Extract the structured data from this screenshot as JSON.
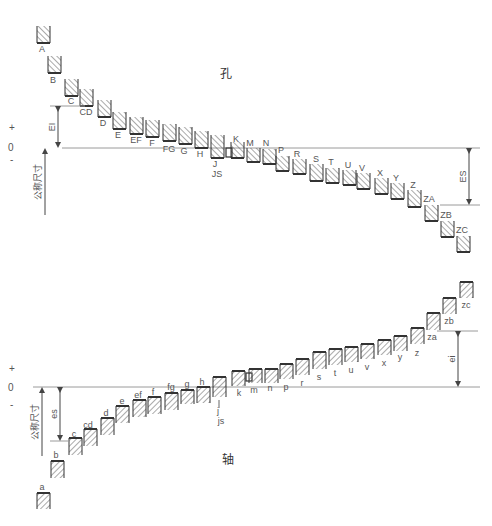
{
  "hole": {
    "title": "孔",
    "title_pos": [
      220,
      78
    ],
    "zero_y": 148,
    "zero_line": [
      62,
      480
    ],
    "signs": {
      "plus": "+",
      "zero": "0",
      "minus": "-",
      "plus_y": 131,
      "zero_y": 151,
      "minus_y": 163
    },
    "nominal_label": "公称尺寸",
    "nominal_arrow": {
      "x": 45,
      "y1": 148,
      "y2": 215
    },
    "EI": {
      "label": "EI",
      "x": 58,
      "y1": 106,
      "y2": 148,
      "ref_line": [
        50,
        85,
        106
      ]
    },
    "ES": {
      "label": "ES",
      "x": 469,
      "y1": 148,
      "y2": 205,
      "ref_line": [
        440,
        480,
        205
      ]
    },
    "boxes": [
      {
        "label": "A",
        "x": 37,
        "top": 26,
        "bottom": 43,
        "lx": 42,
        "ly": 52
      },
      {
        "label": "B",
        "x": 48,
        "top": 56,
        "bottom": 73,
        "lx": 53,
        "ly": 83
      },
      {
        "label": "C",
        "x": 65,
        "top": 79,
        "bottom": 96,
        "lx": 71,
        "ly": 104
      },
      {
        "label": "CD",
        "x": 80,
        "top": 89,
        "bottom": 106,
        "lx": 86,
        "ly": 115
      },
      {
        "label": "D",
        "x": 98,
        "top": 100,
        "bottom": 117,
        "lx": 103,
        "ly": 126
      },
      {
        "label": "E",
        "x": 113,
        "top": 112,
        "bottom": 129,
        "lx": 118,
        "ly": 138
      },
      {
        "label": "EF",
        "x": 130,
        "top": 117,
        "bottom": 134,
        "lx": 136,
        "ly": 143
      },
      {
        "label": "F",
        "x": 146,
        "top": 120,
        "bottom": 137,
        "lx": 152,
        "ly": 146
      },
      {
        "label": "FG",
        "x": 163,
        "top": 124,
        "bottom": 141,
        "lx": 169,
        "ly": 152
      },
      {
        "label": "G",
        "x": 179,
        "top": 127,
        "bottom": 144,
        "lx": 184,
        "ly": 154
      },
      {
        "label": "H",
        "x": 195,
        "top": 131,
        "bottom": 148,
        "lx": 200,
        "ly": 157
      },
      {
        "label": "J",
        "x": 211,
        "top": 135,
        "bottom": 158,
        "lx": 215,
        "ly": 167
      },
      {
        "label": "K",
        "x": 231,
        "top": 142,
        "bottom": 158,
        "lx": 236,
        "ly": 142
      },
      {
        "label": "M",
        "x": 247,
        "top": 148,
        "bottom": 162,
        "lx": 250,
        "ly": 146
      },
      {
        "label": "N",
        "x": 263,
        "top": 149,
        "bottom": 164,
        "lx": 266,
        "ly": 146
      },
      {
        "label": "P",
        "x": 276,
        "top": 156,
        "bottom": 171,
        "lx": 281,
        "ly": 153
      },
      {
        "label": "R",
        "x": 293,
        "top": 159,
        "bottom": 174,
        "lx": 297,
        "ly": 157
      },
      {
        "label": "S",
        "x": 310,
        "top": 164,
        "bottom": 181,
        "lx": 316,
        "ly": 162
      },
      {
        "label": "T",
        "x": 326,
        "top": 168,
        "bottom": 183,
        "lx": 331,
        "ly": 165
      },
      {
        "label": "U",
        "x": 343,
        "top": 170,
        "bottom": 185,
        "lx": 348,
        "ly": 168
      },
      {
        "label": "V",
        "x": 357,
        "top": 173,
        "bottom": 189,
        "lx": 362,
        "ly": 171
      },
      {
        "label": "X",
        "x": 375,
        "top": 178,
        "bottom": 194,
        "lx": 380,
        "ly": 176
      },
      {
        "label": "Y",
        "x": 391,
        "top": 183,
        "bottom": 199,
        "lx": 396,
        "ly": 181
      },
      {
        "label": "Z",
        "x": 408,
        "top": 190,
        "bottom": 207,
        "lx": 413,
        "ly": 188
      },
      {
        "label": "ZA",
        "x": 425,
        "top": 205,
        "bottom": 221,
        "lx": 429,
        "ly": 202
      },
      {
        "label": "ZB",
        "x": 441,
        "top": 221,
        "bottom": 237,
        "lx": 446,
        "ly": 218
      },
      {
        "label": "ZC",
        "x": 457,
        "top": 236,
        "bottom": 252,
        "lx": 462,
        "ly": 233
      }
    ],
    "js_label": {
      "text": "JS",
      "x": 217,
      "y": 177
    },
    "k_small": {
      "x": 226,
      "top": 148,
      "bottom": 157
    }
  },
  "shaft": {
    "title": "轴",
    "title_pos": [
      222,
      464
    ],
    "zero_y": 387,
    "zero_line": [
      33,
      480
    ],
    "signs": {
      "plus": "+",
      "zero": "0",
      "minus": "-",
      "plus_y": 372,
      "zero_y": 391,
      "minus_y": 408
    },
    "nominal_label": "公称尺寸",
    "nominal_arrow": {
      "x": 42,
      "y1": 387,
      "y2": 456
    },
    "es": {
      "label": "es",
      "x": 60,
      "y1": 387,
      "y2": 441,
      "ref_line": [
        50,
        70,
        441
      ]
    },
    "ei": {
      "label": "ei",
      "x": 458,
      "y1": 331,
      "y2": 387,
      "ref_line": [
        437,
        478,
        331
      ]
    },
    "boxes": [
      {
        "label": "a",
        "x": 37,
        "top": 493,
        "bottom": 509,
        "lx": 42,
        "ly": 490
      },
      {
        "label": "b",
        "x": 51,
        "top": 461,
        "bottom": 478,
        "lx": 56,
        "ly": 458
      },
      {
        "label": "c",
        "x": 69,
        "top": 438,
        "bottom": 455,
        "lx": 74,
        "ly": 437
      },
      {
        "label": "cd",
        "x": 84,
        "top": 429,
        "bottom": 446,
        "lx": 88,
        "ly": 428
      },
      {
        "label": "d",
        "x": 101,
        "top": 418,
        "bottom": 435,
        "lx": 106,
        "ly": 416
      },
      {
        "label": "e",
        "x": 116,
        "top": 406,
        "bottom": 423,
        "lx": 122,
        "ly": 404
      },
      {
        "label": "ef",
        "x": 133,
        "top": 400,
        "bottom": 417,
        "lx": 138,
        "ly": 398
      },
      {
        "label": "f",
        "x": 148,
        "top": 397,
        "bottom": 414,
        "lx": 153,
        "ly": 395
      },
      {
        "label": "fg",
        "x": 165,
        "top": 393,
        "bottom": 410,
        "lx": 171,
        "ly": 390
      },
      {
        "label": "g",
        "x": 181,
        "top": 390,
        "bottom": 404,
        "lx": 187,
        "ly": 387
      },
      {
        "label": "h",
        "x": 197,
        "top": 387,
        "bottom": 403,
        "lx": 202,
        "ly": 385
      },
      {
        "label": "j",
        "x": 213,
        "top": 377,
        "bottom": 397,
        "lx": 218,
        "ly": 414
      },
      {
        "label": "k",
        "x": 232,
        "top": 371,
        "bottom": 386,
        "lx": 239,
        "ly": 396
      },
      {
        "label": "m",
        "x": 249,
        "top": 369,
        "bottom": 383,
        "lx": 254,
        "ly": 393
      },
      {
        "label": "n",
        "x": 265,
        "top": 369,
        "bottom": 383,
        "lx": 270,
        "ly": 391
      },
      {
        "label": "p",
        "x": 280,
        "top": 364,
        "bottom": 379,
        "lx": 286,
        "ly": 390
      },
      {
        "label": "r",
        "x": 296,
        "top": 359,
        "bottom": 375,
        "lx": 302,
        "ly": 386
      },
      {
        "label": "s",
        "x": 313,
        "top": 352,
        "bottom": 369,
        "lx": 319,
        "ly": 380
      },
      {
        "label": "t",
        "x": 329,
        "top": 349,
        "bottom": 365,
        "lx": 335,
        "ly": 376
      },
      {
        "label": "u",
        "x": 345,
        "top": 347,
        "bottom": 362,
        "lx": 351,
        "ly": 373
      },
      {
        "label": "v",
        "x": 361,
        "top": 344,
        "bottom": 359,
        "lx": 367,
        "ly": 370
      },
      {
        "label": "x",
        "x": 378,
        "top": 340,
        "bottom": 355,
        "lx": 384,
        "ly": 366
      },
      {
        "label": "y",
        "x": 394,
        "top": 336,
        "bottom": 351,
        "lx": 400,
        "ly": 360
      },
      {
        "label": "z",
        "x": 411,
        "top": 328,
        "bottom": 344,
        "lx": 417,
        "ly": 356
      },
      {
        "label": "za",
        "x": 427,
        "top": 313,
        "bottom": 330,
        "lx": 432,
        "ly": 340
      },
      {
        "label": "zb",
        "x": 443,
        "top": 298,
        "bottom": 314,
        "lx": 449,
        "ly": 324
      },
      {
        "label": "zc",
        "x": 460,
        "top": 282,
        "bottom": 298,
        "lx": 466,
        "ly": 308
      }
    ],
    "js_label": {
      "text": "js",
      "x": 221,
      "y": 424
    },
    "k_small": {
      "x": 246,
      "top": 373,
      "bottom": 381
    }
  },
  "colors": {
    "line": "#9a9a9a",
    "box": "#333333",
    "hatch": "#555555",
    "text": "#555555"
  },
  "box_width": 13
}
